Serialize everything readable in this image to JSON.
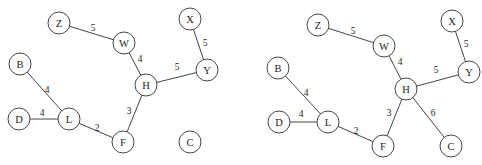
{
  "page": {
    "background": "#ffffff",
    "stroke_color": "#454545",
    "text_color": "#1c1c1c",
    "node_fill": "#ffffff",
    "node_radius": 11
  },
  "diagram": {
    "graphs": [
      {
        "name": "graph-left",
        "nodes": [
          {
            "id": "Z",
            "x": 59,
            "y": 23
          },
          {
            "id": "W",
            "x": 124,
            "y": 43
          },
          {
            "id": "X",
            "x": 190,
            "y": 19
          },
          {
            "id": "Y",
            "x": 207,
            "y": 70
          },
          {
            "id": "B",
            "x": 20,
            "y": 64
          },
          {
            "id": "H",
            "x": 146,
            "y": 85
          },
          {
            "id": "D",
            "x": 19,
            "y": 119
          },
          {
            "id": "L",
            "x": 69,
            "y": 119
          },
          {
            "id": "F",
            "x": 123,
            "y": 142
          },
          {
            "id": "C",
            "x": 190,
            "y": 142
          }
        ],
        "edges": [
          {
            "from": "Z",
            "to": "W",
            "weight": "5",
            "lx": 93,
            "ly": 28
          },
          {
            "from": "W",
            "to": "H",
            "weight": "4",
            "lx": 140,
            "ly": 59
          },
          {
            "from": "X",
            "to": "Y",
            "weight": "5",
            "lx": 205,
            "ly": 43
          },
          {
            "from": "H",
            "to": "Y",
            "weight": "5",
            "lx": 177,
            "ly": 67
          },
          {
            "from": "B",
            "to": "L",
            "weight": "4",
            "lx": 47,
            "ly": 90
          },
          {
            "from": "D",
            "to": "L",
            "weight": "4",
            "lx": 42,
            "ly": 113
          },
          {
            "from": "L",
            "to": "F",
            "weight": "2",
            "lx": 97,
            "ly": 128
          },
          {
            "from": "F",
            "to": "H",
            "weight": "3",
            "lx": 129,
            "ly": 111
          }
        ]
      },
      {
        "name": "graph-right",
        "nodes": [
          {
            "id": "Z",
            "x": 318,
            "y": 25
          },
          {
            "id": "W",
            "x": 384,
            "y": 46
          },
          {
            "id": "X",
            "x": 452,
            "y": 21
          },
          {
            "id": "Y",
            "x": 469,
            "y": 72
          },
          {
            "id": "B",
            "x": 278,
            "y": 68
          },
          {
            "id": "H",
            "x": 406,
            "y": 89
          },
          {
            "id": "D",
            "x": 279,
            "y": 122
          },
          {
            "id": "L",
            "x": 328,
            "y": 122
          },
          {
            "id": "F",
            "x": 383,
            "y": 146
          },
          {
            "id": "C",
            "x": 451,
            "y": 146
          }
        ],
        "edges": [
          {
            "from": "Z",
            "to": "W",
            "weight": "5",
            "lx": 353,
            "ly": 31
          },
          {
            "from": "W",
            "to": "H",
            "weight": "4",
            "lx": 400,
            "ly": 62
          },
          {
            "from": "X",
            "to": "Y",
            "weight": "5",
            "lx": 466,
            "ly": 44
          },
          {
            "from": "H",
            "to": "Y",
            "weight": "5",
            "lx": 436,
            "ly": 70
          },
          {
            "from": "B",
            "to": "L",
            "weight": "4",
            "lx": 306,
            "ly": 93
          },
          {
            "from": "D",
            "to": "L",
            "weight": "4",
            "lx": 301,
            "ly": 114
          },
          {
            "from": "L",
            "to": "F",
            "weight": "2",
            "lx": 356,
            "ly": 131
          },
          {
            "from": "F",
            "to": "H",
            "weight": "3",
            "lx": 389,
            "ly": 113
          },
          {
            "from": "H",
            "to": "C",
            "weight": "6",
            "lx": 433,
            "ly": 113
          }
        ]
      }
    ]
  }
}
